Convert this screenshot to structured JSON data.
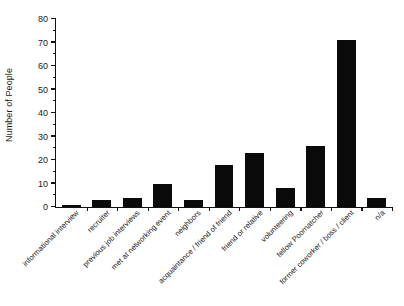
{
  "chart_data": {
    "type": "bar",
    "title": "",
    "xlabel": "",
    "ylabel": "Number of People",
    "ylim": [
      0,
      80
    ],
    "ytick_step": 10,
    "yminor_step": 5,
    "grid": false,
    "legend": "none",
    "bar_color": "#0a0a0a",
    "categories": [
      "informational interview",
      "recruiter",
      "previous job interviews",
      "met at networking event",
      "neighbors",
      "acquaintance / friend of friend",
      "friend or relative",
      "volunteering",
      "fellow Poornatcher",
      "former coworker / boss / client",
      "n/a"
    ],
    "values": [
      1,
      3,
      4,
      10,
      3,
      18,
      23,
      8,
      26,
      71,
      4
    ],
    "ytick_labels": [
      "0",
      "10",
      "20",
      "30",
      "40",
      "50",
      "60",
      "70",
      "80"
    ]
  }
}
